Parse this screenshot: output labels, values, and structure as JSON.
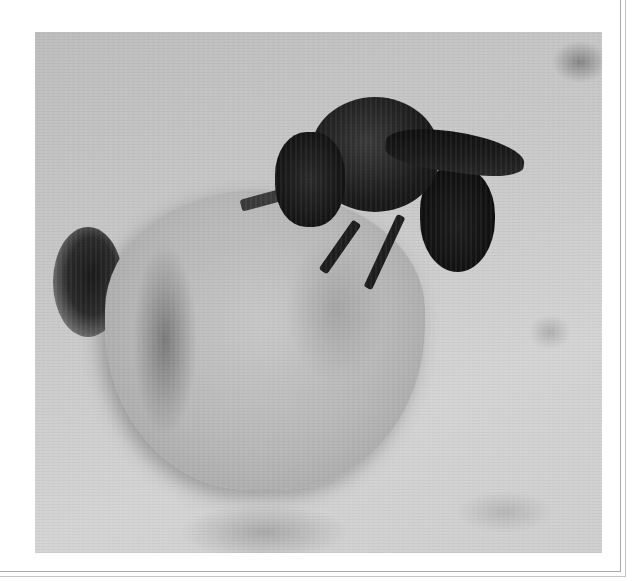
{
  "image": {
    "description": "Black-and-white photograph of a dark, furry bee perched on top of a rough mud/sand turret nest, with a dark shadowed hole at the lower left on a grainy sandy ground",
    "subjects": [
      "bee",
      "mud-nest-turret",
      "nest-hole-shadow",
      "sandy-ground"
    ],
    "color_mode": "grayscale",
    "frame": {
      "style": "double-line border on right and bottom edges",
      "line_color": "#a9a9a9",
      "background": "#ffffff"
    }
  }
}
